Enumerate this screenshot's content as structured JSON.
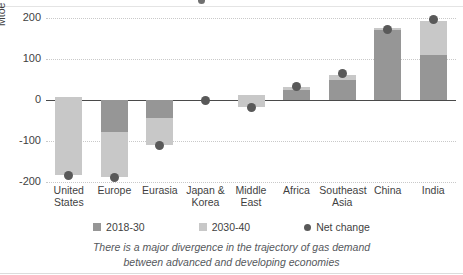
{
  "chart_data": {
    "type": "bar",
    "title": "",
    "subtitle": "",
    "xlabel": "",
    "ylabel": "Mtoe",
    "ylim": [
      -200,
      200
    ],
    "yticks": [
      200,
      100,
      0,
      -100,
      -200
    ],
    "grid": true,
    "legend_position": "bottom",
    "categories": [
      "United States",
      "Europe",
      "Eurasia",
      "Japan & Korea",
      "Middle East",
      "Africa",
      "Southeast Asia",
      "China",
      "India"
    ],
    "category_lines": [
      [
        "United",
        "States"
      ],
      [
        "Europe",
        ""
      ],
      [
        "Eurasia",
        ""
      ],
      [
        "Japan &",
        "Korea"
      ],
      [
        "Middle",
        "East"
      ],
      [
        "Africa",
        ""
      ],
      [
        "Southeast",
        "Asia"
      ],
      [
        "China",
        ""
      ],
      [
        "India",
        ""
      ]
    ],
    "series": [
      {
        "name": "2018-30",
        "color": "#969696",
        "values": [
          8,
          -78,
          -45,
          0,
          13,
          25,
          48,
          175,
          110
        ]
      },
      {
        "name": "2030-40",
        "color": "#c8c8c8",
        "values": [
          -192,
          -110,
          -65,
          0,
          -30,
          6,
          13,
          -3,
          83
        ]
      },
      {
        "name": "Net change",
        "color": "#595959",
        "type": "scatter",
        "values": [
          -184,
          -188,
          -110,
          0,
          -18,
          32,
          65,
          172,
          197
        ]
      }
    ]
  },
  "axis": {
    "y_title": "Mtoe",
    "y_ticks": [
      "200",
      "100",
      "0",
      "-100",
      "-200"
    ]
  },
  "legend": {
    "items": [
      {
        "label": "2018-30",
        "marker": "square-dark-icon"
      },
      {
        "label": "2030-40",
        "marker": "square-light-icon"
      },
      {
        "label": "Net change",
        "marker": "dot-icon"
      }
    ]
  },
  "caption": {
    "line1": "There is a major divergence in the trajectory of gas demand",
    "line2": "between advanced and developing economies"
  },
  "colors": {
    "series_2018_30": "#969696",
    "series_2030_40": "#c8c8c8",
    "net_change": "#595959",
    "gridline": "#c9c9c9",
    "zeroline": "#4a4a4a",
    "text": "#3f3f3f"
  }
}
